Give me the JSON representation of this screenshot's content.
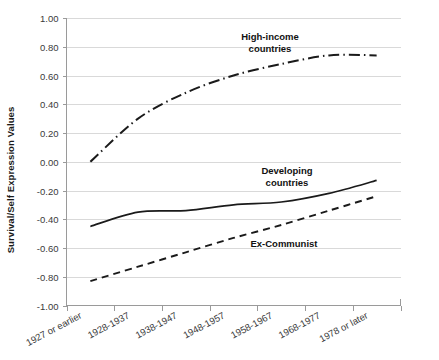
{
  "chart_data": {
    "type": "line",
    "title": "",
    "xlabel": "",
    "ylabel": "Survival/Self Expression Values",
    "ylim": [
      -1.0,
      1.0
    ],
    "ytick_step": 0.2,
    "grid": true,
    "legend_position": "inline-annotations",
    "categories": [
      "1927 or earlier",
      "1928-1937",
      "1938-1947",
      "1948-1957",
      "1958-1967",
      "1968-1977",
      "1978 or later"
    ],
    "ytick_labels": [
      "1.00",
      "0.80",
      "0.60",
      "0.40",
      "0.20",
      "0.00",
      "-0.20",
      "-0.40",
      "-0.60",
      "-0.80",
      "-1.00"
    ],
    "ytick_values": [
      1.0,
      0.8,
      0.6,
      0.4,
      0.2,
      0.0,
      -0.2,
      -0.4,
      -0.6,
      -0.8,
      -1.0
    ],
    "series": [
      {
        "name": "High-income countries",
        "label_lines": [
          "High-income",
          "countries"
        ],
        "style": "dash-dot",
        "color": "#1a1a1a",
        "values": [
          0.0,
          0.3,
          0.48,
          0.6,
          0.68,
          0.74,
          0.74
        ]
      },
      {
        "name": "Developing countries",
        "label_lines": [
          "Developing",
          "countries"
        ],
        "style": "solid",
        "color": "#1a1a1a",
        "values": [
          -0.45,
          -0.35,
          -0.34,
          -0.3,
          -0.28,
          -0.22,
          -0.13
        ]
      },
      {
        "name": "Ex-Communist",
        "label_lines": [
          "Ex-Communist"
        ],
        "style": "dashed",
        "color": "#1a1a1a",
        "values": [
          -0.83,
          -0.73,
          -0.63,
          -0.53,
          -0.44,
          -0.34,
          -0.24
        ]
      }
    ],
    "annotations": [
      {
        "text": "High-income countries",
        "series": "High-income countries"
      },
      {
        "text": "Developing countries",
        "series": "Developing countries"
      },
      {
        "text": "Ex-Communist",
        "series": "Ex-Communist"
      }
    ],
    "colors": {
      "line": "#1a1a1a",
      "grid": "#d9d9d9",
      "axis": "#9a9a9a",
      "background": "#ffffff",
      "text": "#3a3a3a"
    }
  }
}
